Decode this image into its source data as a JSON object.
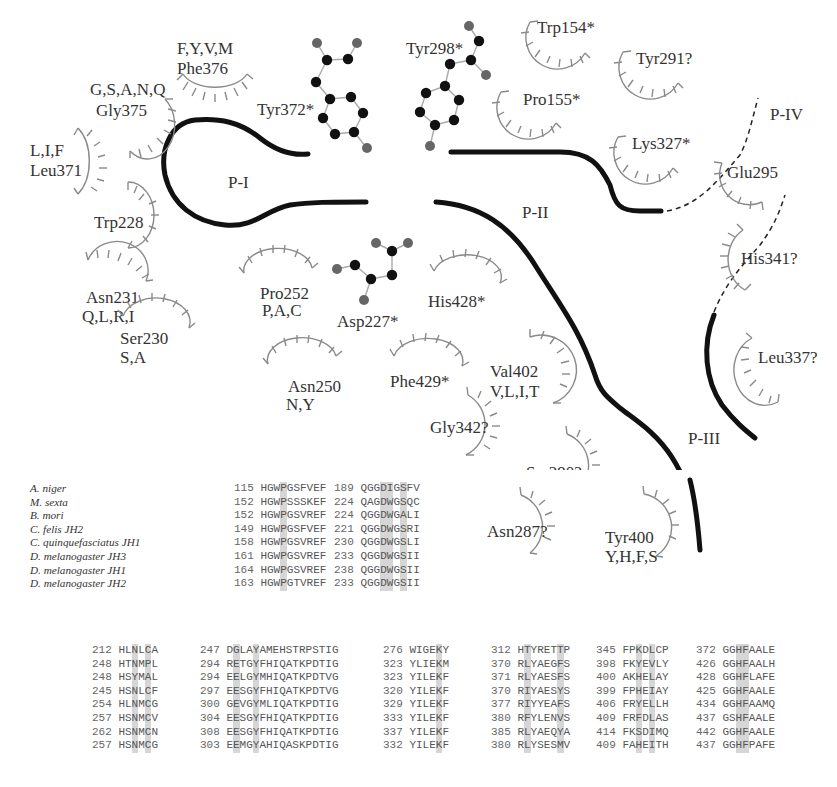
{
  "diagram": {
    "pockets": [
      {
        "id": "P-I",
        "label": "P-I"
      },
      {
        "id": "P-II",
        "label": "P-II"
      },
      {
        "id": "P-III",
        "label": "P-III"
      },
      {
        "id": "P-IV",
        "label": "P-IV"
      }
    ],
    "molecules": [
      {
        "label": "Tyr372*"
      },
      {
        "label": "Tyr298*"
      },
      {
        "label": "Asp227*"
      }
    ],
    "residues": [
      {
        "name": "Phe376",
        "variants": "F,Y,V,M"
      },
      {
        "name": "Gly375",
        "variants": "G,S,A,N,Q"
      },
      {
        "name": "Leu371",
        "variants": "L,I,F"
      },
      {
        "name": "Trp228",
        "variants": ""
      },
      {
        "name": "Asn231",
        "variants": "Q,L,R,I"
      },
      {
        "name": "Ser230",
        "variants": "S,A"
      },
      {
        "name": "Pro252",
        "variants": "P,A,C"
      },
      {
        "name": "Asn250",
        "variants": "N,Y"
      },
      {
        "name": "His428*",
        "variants": ""
      },
      {
        "name": "Phe429*",
        "variants": ""
      },
      {
        "name": "Val402",
        "variants": "V,L,I,T"
      },
      {
        "name": "Gly342?",
        "variants": ""
      },
      {
        "name": "Ser290?",
        "variants": ""
      },
      {
        "name": "Asn287?",
        "variants": ""
      },
      {
        "name": "Tyr400",
        "variants": "Y,H,F,S"
      },
      {
        "name": "Trp154*",
        "variants": ""
      },
      {
        "name": "Tyr291?",
        "variants": ""
      },
      {
        "name": "Pro155*",
        "variants": ""
      },
      {
        "name": "Lys327*",
        "variants": ""
      },
      {
        "name": "Glu295",
        "variants": ""
      },
      {
        "name": "His341?",
        "variants": ""
      },
      {
        "name": "Leu337?",
        "variants": ""
      }
    ]
  },
  "alignment_top": {
    "species": [
      "A. niger",
      "M. sexta",
      "B. mori",
      "C. felis JH2",
      "C. quinquefasciatus JH1",
      "D. melanogaster JH3",
      "D. melanogaster JH1",
      "D. melanogaster JH2"
    ],
    "blocks": [
      {
        "highlight_cols": [
          3
        ],
        "rows": [
          {
            "num": "115",
            "seq": "HGWPGSFVEF"
          },
          {
            "num": "152",
            "seq": "HGWPSSSKEF"
          },
          {
            "num": "152",
            "seq": "HGWPGSVREF"
          },
          {
            "num": "149",
            "seq": "HGWPGSFVEF"
          },
          {
            "num": "158",
            "seq": "HGWPGSVREF"
          },
          {
            "num": "161",
            "seq": "HGWPGSVREF"
          },
          {
            "num": "164",
            "seq": "HGWPGSVREF"
          },
          {
            "num": "163",
            "seq": "HGWPGTVREF"
          }
        ]
      },
      {
        "highlight_cols": [
          3,
          4,
          6
        ],
        "rows": [
          {
            "num": "189",
            "seq": "QGGDIGSFV"
          },
          {
            "num": "224",
            "seq": "QAGDWGSQC"
          },
          {
            "num": "224",
            "seq": "QGGDWGALI"
          },
          {
            "num": "221",
            "seq": "QGGDWGSRI"
          },
          {
            "num": "230",
            "seq": "QGGDWGSLI"
          },
          {
            "num": "233",
            "seq": "QGGDWGSII"
          },
          {
            "num": "238",
            "seq": "QGGDWGSII"
          },
          {
            "num": "233",
            "seq": "QGGDWGSII"
          }
        ]
      }
    ]
  },
  "alignment_bottom": {
    "blocks": [
      {
        "highlight_cols": [
          2,
          4
        ],
        "rows": [
          {
            "num": "212",
            "seq": "HLNLCA"
          },
          {
            "num": "248",
            "seq": "HTNMPL"
          },
          {
            "num": "248",
            "seq": "HSYMAL"
          },
          {
            "num": "245",
            "seq": "HSNLCF"
          },
          {
            "num": "254",
            "seq": "HLNMCG"
          },
          {
            "num": "257",
            "seq": "HSNMCV"
          },
          {
            "num": "262",
            "seq": "HSNMCN"
          },
          {
            "num": "257",
            "seq": "HSNMCG"
          }
        ]
      },
      {
        "highlight_cols": [
          1,
          4
        ],
        "rows": [
          {
            "num": "247",
            "seq": "DGLAYAMEHSTRPSTIG"
          },
          {
            "num": "294",
            "seq": "RETGYFHIQATKPDTIG"
          },
          {
            "num": "294",
            "seq": "EELGYMHIQATKPDTVG"
          },
          {
            "num": "297",
            "seq": "EESGYFHIQATKPDTVG"
          },
          {
            "num": "300",
            "seq": "GEVGYMLIQATKPDTIG"
          },
          {
            "num": "304",
            "seq": "EESGYFHIQATKPDTIG"
          },
          {
            "num": "308",
            "seq": "EESGYFHIQATKPDTIG"
          },
          {
            "num": "303",
            "seq": "EEMGYAHIQASKPDTIG"
          }
        ]
      },
      {
        "highlight_cols": [
          4
        ],
        "rows": [
          {
            "num": "276",
            "seq": "WIGEKY"
          },
          {
            "num": "323",
            "seq": "YLIEKM"
          },
          {
            "num": "323",
            "seq": "YILEKF"
          },
          {
            "num": "320",
            "seq": "YILEKF"
          },
          {
            "num": "329",
            "seq": "YILEKF"
          },
          {
            "num": "333",
            "seq": "YILEKF"
          },
          {
            "num": "337",
            "seq": "YILEKF"
          },
          {
            "num": "332",
            "seq": "YILEKF"
          }
        ]
      },
      {
        "highlight_cols": [
          1,
          6
        ],
        "rows": [
          {
            "num": "312",
            "seq": "HTYRETTP"
          },
          {
            "num": "370",
            "seq": "RLYAEGFS"
          },
          {
            "num": "371",
            "seq": "RLYAESFS"
          },
          {
            "num": "370",
            "seq": "RIYAESYS"
          },
          {
            "num": "377",
            "seq": "RIYYEAFS"
          },
          {
            "num": "380",
            "seq": "RFYLENVS"
          },
          {
            "num": "385",
            "seq": "RLYAEQYA"
          },
          {
            "num": "380",
            "seq": "RLYSESMV"
          }
        ]
      },
      {
        "highlight_cols": [
          2,
          4
        ],
        "rows": [
          {
            "num": "345",
            "seq": "FPKDLCP"
          },
          {
            "num": "398",
            "seq": "FKYEVLY"
          },
          {
            "num": "400",
            "seq": "AKHELAY"
          },
          {
            "num": "399",
            "seq": "FPHEIAY"
          },
          {
            "num": "406",
            "seq": "FRYELLH"
          },
          {
            "num": "409",
            "seq": "FRFDLAS"
          },
          {
            "num": "414",
            "seq": "FKSDIMQ"
          },
          {
            "num": "409",
            "seq": "FAHEITH"
          }
        ]
      },
      {
        "highlight_cols": [
          2,
          3
        ],
        "rows": [
          {
            "num": "372",
            "seq": "GGHFAALE"
          },
          {
            "num": "426",
            "seq": "GGHFAALH"
          },
          {
            "num": "428",
            "seq": "GGHFLAFE"
          },
          {
            "num": "425",
            "seq": "GGHFAALE"
          },
          {
            "num": "434",
            "seq": "GGHFAAMQ"
          },
          {
            "num": "437",
            "seq": "GSHFAALE"
          },
          {
            "num": "442",
            "seq": "GGHFAALE"
          },
          {
            "num": "437",
            "seq": "GGHFPAFE"
          }
        ]
      }
    ]
  }
}
